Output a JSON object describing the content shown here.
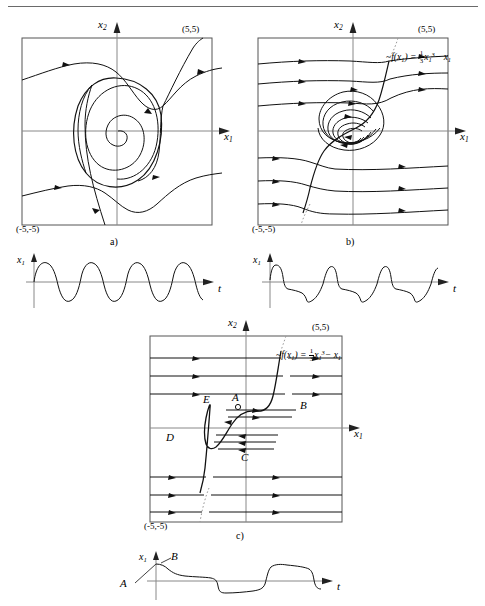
{
  "figure": {
    "top_rule": true,
    "axis_labels": {
      "x1": "x",
      "x1_sub": "1",
      "x2": "x",
      "x2_sub": "2",
      "t": "t"
    },
    "corner_max": "(5,5)",
    "corner_min": "(-5,-5)",
    "nullcline_label": {
      "lhs": "f(x",
      "lhs_sub": "1",
      "lhs_close": ") =",
      "num": "1",
      "den": "3",
      "var": "x",
      "var_sub": "1",
      "var_sup": "3",
      "tail": "− x",
      "tail_sub": "1"
    },
    "panels": [
      {
        "id": "a",
        "caption": "a)",
        "kind": "phase-portrait",
        "description": "Van der Pol phase plane, small epsilon: trajectories spiral outward from origin onto a nearly circular limit cycle",
        "has_nullcline": false,
        "xlim": [
          -5,
          5
        ],
        "ylim": [
          -5,
          5
        ],
        "time_plot": {
          "kind": "time-series",
          "description": "nearly sinusoidal oscillation of x1 versus t",
          "cycles": 5,
          "waveform": "sinusoidal"
        }
      },
      {
        "id": "b",
        "caption": "b)",
        "kind": "phase-portrait",
        "description": "Van der Pol phase plane, moderate epsilon: trajectories spiral onto a relaxation-type limit cycle following the cubic nullcline",
        "has_nullcline": true,
        "xlim": [
          -5,
          5
        ],
        "ylim": [
          -5,
          5
        ],
        "time_plot": {
          "kind": "time-series",
          "description": "relaxation oscillation of x1 versus t with fast jumps and slow decays",
          "cycles": 4,
          "waveform": "relaxation"
        }
      },
      {
        "id": "c",
        "caption": "c)",
        "kind": "phase-portrait",
        "description": "Van der Pol phase plane, large epsilon: horizontal fast fibers and slow motion along the cubic nullcline branches, limit cycle A-B-C-D-E",
        "has_nullcline": true,
        "xlim": [
          -5,
          5
        ],
        "ylim": [
          -5,
          5
        ],
        "points": [
          {
            "name": "A",
            "x": 196,
            "y": 406
          },
          {
            "name": "B",
            "x": 278,
            "y": 409
          },
          {
            "name": "C",
            "x": 243,
            "y": 444
          },
          {
            "name": "D",
            "x": 169,
            "y": 432
          },
          {
            "name": "E",
            "x": 206,
            "y": 404
          }
        ],
        "time_plot": {
          "kind": "time-series",
          "description": "square-wave-like relaxation oscillation of x1 versus t, starting at A and jumping to B",
          "cycles": 3,
          "waveform": "square-relaxation",
          "points": [
            {
              "name": "A",
              "x": 117,
              "y": 586
            },
            {
              "name": "B",
              "x": 151,
              "y": 554
            }
          ]
        }
      }
    ]
  }
}
